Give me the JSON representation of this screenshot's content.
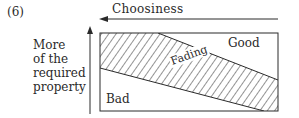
{
  "figure": {
    "number": "(6)",
    "x_axis": {
      "label": "Choosiness",
      "direction": "right-to-left"
    },
    "y_axis": {
      "label_lines": [
        "More",
        "of the",
        "required",
        "property"
      ],
      "direction": "bottom-to-top"
    },
    "regions": {
      "top_right": "Good",
      "band": "Fading",
      "bottom_left": "Bad"
    },
    "colors": {
      "ink": "#2a2a2a",
      "background": "#ffffff"
    }
  }
}
